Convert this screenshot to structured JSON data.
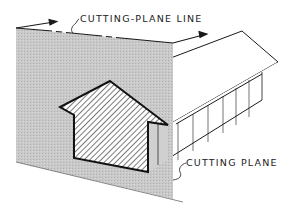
{
  "diagram": {
    "type": "technical-illustration",
    "labels": {
      "cutting_plane_line": "CUTTING-PLANE LINE",
      "cutting_plane": "CUTTING PLANE"
    },
    "colors": {
      "plane_fill": "#c8c8c8",
      "line": "#1a1a1a",
      "hatch": "#333333",
      "background": "#ffffff"
    }
  }
}
